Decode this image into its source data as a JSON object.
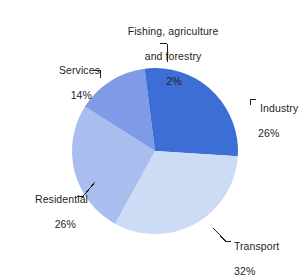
{
  "chart_data": {
    "type": "pie",
    "title": "",
    "subtitle": "",
    "xlabel": "",
    "ylabel": "",
    "legend_position": "none",
    "grid": false,
    "units": "%",
    "start_angle_deg": 0,
    "direction": "clockwise",
    "categories": [
      "Industry",
      "Transport",
      "Residential",
      "Services",
      "Fishing, agriculture and forestry"
    ],
    "values": [
      26,
      32,
      26,
      14,
      2
    ],
    "labels": [
      "Industry",
      "Transport",
      "Residential",
      "Services",
      "Fishing, agriculture and forestry"
    ],
    "value_labels": [
      "26%",
      "32%",
      "26%",
      "14%",
      "2%"
    ],
    "colors": [
      "#3c6ed6",
      "#ccdcf5",
      "#a9bdee",
      "#7f9ae6",
      "#3c6ed6"
    ],
    "slices": [
      {
        "name": "Industry",
        "value": 26,
        "value_label": "26%",
        "color": "#3c6ed6"
      },
      {
        "name": "Transport",
        "value": 32,
        "value_label": "32%",
        "color": "#ccdcf5"
      },
      {
        "name": "Residential",
        "value": 26,
        "value_label": "26%",
        "color": "#a9bdee"
      },
      {
        "name": "Services",
        "value": 14,
        "value_label": "14%",
        "color": "#7f9ae6"
      },
      {
        "name": "Fishing, agriculture and forestry",
        "value": 2,
        "value_label": "2%",
        "color": "#3c6ed6"
      }
    ]
  },
  "labels": {
    "fishing": {
      "line1": "Fishing, agriculture",
      "line2": "and forestry",
      "percent": "2%"
    },
    "industry": {
      "name": "Industry",
      "percent": "26%"
    },
    "transport": {
      "name": "Transport",
      "percent": "32%"
    },
    "residential": {
      "name": "Residential",
      "percent": "26%"
    },
    "services": {
      "name": "Services",
      "percent": "14%"
    }
  },
  "style": {
    "background": "#ffffff",
    "text_color": "#231f20",
    "leader_color": "#231f20"
  }
}
